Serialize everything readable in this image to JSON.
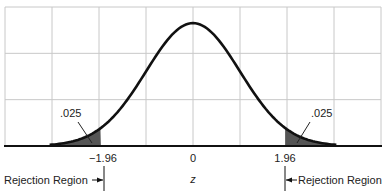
{
  "chart_data": {
    "type": "area",
    "title": "",
    "xlabel": "z",
    "ylabel": "",
    "xlim": [
      -4,
      4
    ],
    "ylim": [
      0,
      0.45
    ],
    "grid": true,
    "grid_x": [
      -4,
      -3,
      -2,
      -1,
      0,
      1,
      2,
      3,
      4
    ],
    "grid_rows": 3,
    "tick_labels": [
      {
        "x": -1.96,
        "label": "−1.96"
      },
      {
        "x": 0,
        "label": "0"
      },
      {
        "x": 1.96,
        "label": "1.96"
      }
    ],
    "series": [
      {
        "name": "Standard normal density",
        "mean": 0,
        "sd": 1,
        "x": [
          -4,
          -3,
          -2,
          -1.96,
          -1,
          0,
          1,
          1.96,
          2,
          3,
          4
        ],
        "y": [
          0.0001,
          0.0044,
          0.054,
          0.0584,
          0.242,
          0.3989,
          0.242,
          0.0584,
          0.054,
          0.0044,
          0.0001
        ]
      }
    ],
    "shaded_regions": [
      {
        "from": -4,
        "to": -1.96,
        "area": 0.025,
        "label": ".025"
      },
      {
        "from": 1.96,
        "to": 4,
        "area": 0.025,
        "label": ".025"
      }
    ],
    "annotations": [
      {
        "text": ".025",
        "points_to": "left tail"
      },
      {
        "text": ".025",
        "points_to": "right tail"
      },
      {
        "text": "Rejection Region",
        "side": "left",
        "boundary": -1.96
      },
      {
        "text": "Rejection Region",
        "side": "right",
        "boundary": 1.96
      }
    ]
  },
  "labels": {
    "left_area": ".025",
    "right_area": ".025",
    "tick_neg": "−1.96",
    "tick_zero": "0",
    "tick_pos": "1.96",
    "axis": "z",
    "left_region": "Rejection Region",
    "right_region": "Rejection Region"
  },
  "colors": {
    "grid": "#c8c8c8",
    "curve": "#111111",
    "shade": "#555555",
    "axis": "#111111"
  }
}
